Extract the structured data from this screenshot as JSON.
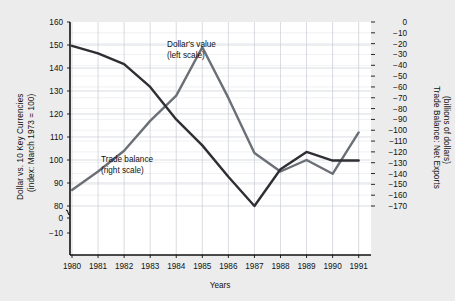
{
  "chart_data": {
    "type": "line",
    "title": "",
    "xlabel": "Years",
    "background": "#ececec",
    "plot_background": "#ffffff",
    "grid": true,
    "grid_color": "#c8cdd4",
    "legend_position": "inline-annotations",
    "x": [
      1980,
      1981,
      1982,
      1983,
      1984,
      1985,
      1986,
      1987,
      1988,
      1989,
      1990,
      1991
    ],
    "xtick_labels": [
      "1980",
      "1981",
      "1982",
      "1983",
      "1984",
      "1985",
      "1986",
      "1987",
      "1988",
      "1989",
      "1990",
      "1991"
    ],
    "left_axis": {
      "label": "Dollar vs. 10 Key Currencies (index: March 1973 = 100)",
      "label_line1": "Dollar vs. 10 Key Currencies",
      "label_line2": "(index: March 1973 = 100)",
      "ticks": [
        160,
        150,
        140,
        130,
        120,
        110,
        100,
        90,
        80,
        0,
        -10
      ],
      "tick_labels": [
        "160",
        "150",
        "140",
        "130",
        "120",
        "110",
        "100",
        "90",
        "80",
        "0",
        "−10"
      ],
      "ylim": [
        80,
        160
      ],
      "axis_break": true,
      "axis_break_between": [
        80,
        0
      ]
    },
    "right_axis": {
      "label": "Trade Balance: Net Exports (billions of dollars)",
      "label_line1": "Trade Balance: Net Exports",
      "label_line2": "(billions of dollars)",
      "ticks": [
        0,
        -10,
        -20,
        -30,
        -40,
        -50,
        -60,
        -70,
        -80,
        -90,
        -100,
        -110,
        -120,
        -130,
        -140,
        -150,
        -160,
        -170
      ],
      "tick_labels": [
        "0",
        "−10",
        "−20",
        "−30",
        "−40",
        "−50",
        "−60",
        "−70",
        "−80",
        "−90",
        "−100",
        "−110",
        "−120",
        "−130",
        "−140",
        "−150",
        "−160",
        "−170"
      ],
      "ylim": [
        -170,
        0
      ]
    },
    "series": [
      {
        "name": "Dollar's value",
        "annotation_line1": "Dollar's value",
        "annotation_line2": "(left scale)",
        "scale": "left",
        "color": "#6b6f76",
        "values": [
          87,
          95,
          104,
          117,
          128,
          149,
          127,
          103,
          95,
          100,
          94,
          112
        ]
      },
      {
        "name": "Trade balance",
        "annotation_line1": "Trade balance",
        "annotation_line2": "(right scale)",
        "scale": "right",
        "color": "#2e2e33",
        "values": [
          -22,
          -29,
          -39,
          -60,
          -90,
          -114,
          -143,
          -170,
          -136,
          -120,
          -128,
          -128
        ]
      }
    ]
  }
}
